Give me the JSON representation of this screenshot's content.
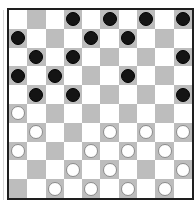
{
  "board": {
    "size": 10,
    "colors": {
      "light": "#ffffff",
      "dark": "#bdbdbd",
      "border": "#1e1e1e",
      "black_piece": "#141414",
      "white_piece": "#ffffff"
    },
    "pieces": {
      "black": [
        [
          0,
          3
        ],
        [
          0,
          5
        ],
        [
          0,
          7
        ],
        [
          0,
          9
        ],
        [
          1,
          0
        ],
        [
          1,
          4
        ],
        [
          1,
          6
        ],
        [
          2,
          1
        ],
        [
          2,
          3
        ],
        [
          2,
          9
        ],
        [
          3,
          0
        ],
        [
          3,
          2
        ],
        [
          3,
          6
        ],
        [
          4,
          1
        ],
        [
          4,
          3
        ],
        [
          4,
          9
        ]
      ],
      "white": [
        [
          5,
          0
        ],
        [
          6,
          1
        ],
        [
          6,
          5
        ],
        [
          6,
          7
        ],
        [
          6,
          9
        ],
        [
          7,
          0
        ],
        [
          7,
          4
        ],
        [
          7,
          6
        ],
        [
          7,
          8
        ],
        [
          8,
          3
        ],
        [
          8,
          5
        ],
        [
          8,
          9
        ],
        [
          9,
          2
        ],
        [
          9,
          4
        ],
        [
          9,
          6
        ],
        [
          9,
          8
        ]
      ]
    },
    "counts": {
      "black": 16,
      "white": 16
    }
  }
}
